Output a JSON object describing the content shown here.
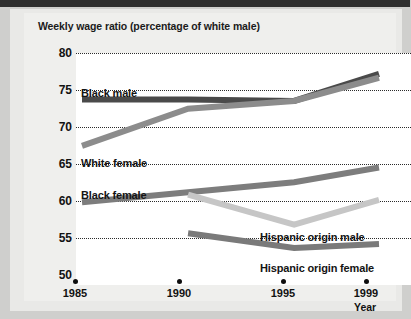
{
  "chart_data": {
    "type": "line",
    "title": "Weekly wage ratio (percentage of white male)",
    "xlabel": "Year",
    "ylabel": "",
    "x": [
      1985,
      1990,
      1995,
      1999
    ],
    "xticklabels": [
      "1985",
      "1990",
      "1995",
      "1999"
    ],
    "yticklabels": [
      "80",
      "75",
      "70",
      "65",
      "60",
      "55",
      "50"
    ],
    "yticks": [
      80,
      75,
      70,
      65,
      60,
      55,
      50
    ],
    "ylim": [
      50,
      80
    ],
    "xlim": [
      1985,
      1999
    ],
    "grid": "horizontal-dotted",
    "legend": "inline-labels",
    "series": [
      {
        "name": "Black male",
        "color": "#4a4a4a",
        "x": [
          1985,
          1990,
          1995,
          1999
        ],
        "values": [
          74.0,
          74.0,
          73.8,
          77.3
        ]
      },
      {
        "name": "White female",
        "color": "#8c8c8c",
        "x": [
          1985,
          1990,
          1995,
          1999
        ],
        "values": [
          68.0,
          72.8,
          73.8,
          76.8
        ]
      },
      {
        "name": "Black female",
        "color": "#7d7d7d",
        "x": [
          1985,
          1990,
          1995,
          1999
        ],
        "values": [
          60.7,
          62.0,
          63.3,
          65.2
        ]
      },
      {
        "name": "Hispanic origin male",
        "color": "#c6c6c6",
        "x": [
          1990,
          1995,
          1999
        ],
        "values": [
          61.7,
          57.8,
          61.0
        ]
      },
      {
        "name": "Hispanic origin female",
        "color": "#7a7a7a",
        "x": [
          1990,
          1995,
          1999
        ],
        "values": [
          56.7,
          54.8,
          55.3
        ]
      }
    ]
  },
  "labels": {
    "black_male": "Black male",
    "white_female": "White female",
    "black_female": "Black female",
    "hispanic_male": "Hispanic origin male",
    "hispanic_female": "Hispanic origin female"
  },
  "yticks": {
    "t0": "80",
    "t1": "75",
    "t2": "70",
    "t3": "65",
    "t4": "60",
    "t5": "55",
    "t6": "50"
  },
  "xticks": {
    "t0": "1985",
    "t1": "1990",
    "t2": "1995",
    "t3": "1999"
  }
}
